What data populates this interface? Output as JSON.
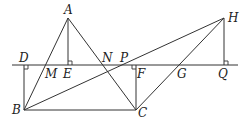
{
  "diagram": {
    "type": "geometry",
    "stroke_color": "#333333",
    "background": "#ffffff",
    "points": {
      "A": {
        "label": "A",
        "x": 68,
        "y": 18
      },
      "B": {
        "label": "B",
        "x": 24,
        "y": 110
      },
      "C": {
        "label": "C",
        "x": 136,
        "y": 110
      },
      "D": {
        "label": "D",
        "x": 24,
        "y": 65
      },
      "E": {
        "label": "E",
        "x": 68,
        "y": 65
      },
      "M": {
        "label": "M",
        "x": 46,
        "y": 65
      },
      "N": {
        "label": "N",
        "x": 103,
        "y": 65
      },
      "P": {
        "label": "P",
        "x": 124,
        "y": 65
      },
      "F": {
        "label": "F",
        "x": 136,
        "y": 65
      },
      "G": {
        "label": "G",
        "x": 181,
        "y": 65
      },
      "Q": {
        "label": "Q",
        "x": 224,
        "y": 65
      },
      "H": {
        "label": "H",
        "x": 224,
        "y": 18
      }
    },
    "segments": [
      [
        "A",
        "B"
      ],
      [
        "A",
        "C"
      ],
      [
        "A",
        "E"
      ],
      [
        "B",
        "C"
      ],
      [
        "B",
        "H"
      ],
      [
        "C",
        "H"
      ],
      [
        "D",
        "B"
      ],
      [
        "F",
        "C"
      ],
      [
        "H",
        "Q"
      ]
    ],
    "line": {
      "label": "horizontal line through D, M, E, N, P, F, G, Q"
    },
    "right_angles": [
      "D",
      "E",
      "F",
      "Q"
    ]
  }
}
